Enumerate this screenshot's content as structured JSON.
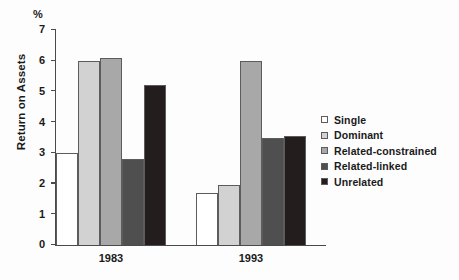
{
  "chart_data": {
    "type": "bar",
    "title": "",
    "subtitle": "",
    "xlabel": "",
    "ylabel": "Return on Assets",
    "unit_label": "%",
    "categories": [
      "1983",
      "1993"
    ],
    "ylim": [
      0,
      7
    ],
    "yticks": [
      "0",
      "1",
      "2",
      "3",
      "4",
      "5",
      "6",
      "7"
    ],
    "grid": false,
    "legend_position": "right",
    "series": [
      {
        "name": "Single",
        "color": "#ffffff",
        "values": [
          3.0,
          1.7
        ]
      },
      {
        "name": "Dominant",
        "color": "#d2d2d2",
        "values": [
          6.0,
          1.95
        ]
      },
      {
        "name": "Related-constrained",
        "color": "#a8a8a8",
        "values": [
          6.1,
          6.0
        ]
      },
      {
        "name": "Related-linked",
        "color": "#4f4f4f",
        "values": [
          2.8,
          3.5
        ]
      },
      {
        "name": "Unrelated",
        "color": "#241d1d",
        "values": [
          5.2,
          3.55
        ]
      }
    ]
  }
}
